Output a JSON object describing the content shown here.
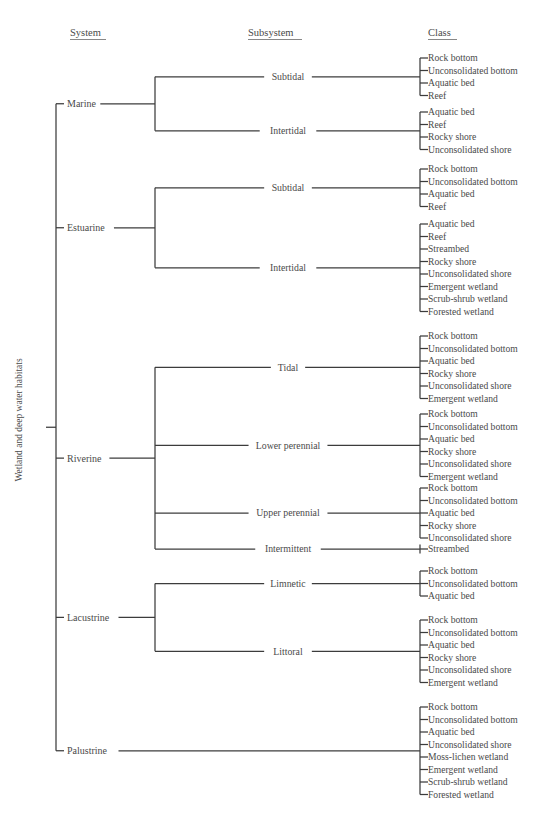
{
  "headers": {
    "system": "System",
    "subsystem": "Subsystem",
    "class": "Class"
  },
  "root": {
    "label": "Wetland and deep water habitats"
  },
  "colors": {
    "line": "#3c3c3c",
    "text": "#4a4a4a",
    "background": "#ffffff"
  },
  "tree": [
    {
      "system": "Marine",
      "subsystems": [
        {
          "name": "Subtidal",
          "classes": [
            "Rock bottom",
            "Unconsolidated bottom",
            "Aquatic bed",
            "Reef"
          ]
        },
        {
          "name": "Intertidal",
          "classes": [
            "Aquatic bed",
            "Reef",
            "Rocky shore",
            "Unconsolidated shore"
          ]
        }
      ]
    },
    {
      "system": "Estuarine",
      "subsystems": [
        {
          "name": "Subtidal",
          "classes": [
            "Rock bottom",
            "Unconsolidated bottom",
            "Aquatic bed",
            "Reef"
          ]
        },
        {
          "name": "Intertidal",
          "classes": [
            "Aquatic bed",
            "Reef",
            "Streambed",
            "Rocky shore",
            "Unconsolidated shore",
            "Emergent wetland",
            "Scrub-shrub wetland",
            "Forested wetland"
          ]
        }
      ]
    },
    {
      "system": "Riverine",
      "subsystems": [
        {
          "name": "Tidal",
          "classes": [
            "Rock bottom",
            "Unconsolidated bottom",
            "Aquatic bed",
            "Rocky shore",
            "Unconsolidated shore",
            "Emergent wetland"
          ]
        },
        {
          "name": "Lower perennial",
          "classes": [
            "Rock bottom",
            "Unconsolidated bottom",
            "Aquatic bed",
            "Rocky shore",
            "Unconsolidated shore",
            "Emergent wetland"
          ]
        },
        {
          "name": "Upper perennial",
          "classes": [
            "Rock bottom",
            "Unconsolidated bottom",
            "Aquatic bed",
            "Rocky shore",
            "Unconsolidated shore"
          ]
        },
        {
          "name": "Intermittent",
          "classes": [
            "Streambed"
          ]
        }
      ]
    },
    {
      "system": "Lacustrine",
      "subsystems": [
        {
          "name": "Limnetic",
          "classes": [
            "Rock bottom",
            "Unconsolidated bottom",
            "Aquatic bed"
          ]
        },
        {
          "name": "Littoral",
          "classes": [
            "Rock bottom",
            "Unconsolidated bottom",
            "Aquatic bed",
            "Rocky shore",
            "Unconsolidated shore",
            "Emergent wetland"
          ]
        }
      ]
    },
    {
      "system": "Palustrine",
      "subsystems": [
        {
          "name": null,
          "classes": [
            "Rock bottom",
            "Unconsolidated bottom",
            "Aquatic bed",
            "Unconsolidated shore",
            "Moss-lichen wetland",
            "Emergent wetland",
            "Scrub-shrub wetland",
            "Forested wetland"
          ]
        }
      ]
    }
  ],
  "layout": {
    "class_rows": [
      [
        58,
        70.5,
        83,
        95.5
      ],
      [
        112,
        124.5,
        137,
        149.5
      ],
      [
        169,
        181.5,
        194,
        206.5
      ],
      [
        224,
        236.5,
        249,
        261.5,
        274,
        286.5,
        299,
        311.5
      ],
      [
        336,
        348.5,
        361,
        373.5,
        386,
        398.5
      ],
      [
        414,
        426.5,
        439,
        451.5,
        464,
        476.5
      ],
      [
        488,
        500.5,
        513,
        525.5,
        538
      ],
      [
        549
      ],
      [
        571,
        583.5,
        596
      ],
      [
        620,
        632.5,
        645,
        657.5,
        670,
        682.5
      ],
      [
        707,
        719.5,
        732,
        744.5,
        757,
        769.5,
        782,
        794.5
      ]
    ]
  }
}
